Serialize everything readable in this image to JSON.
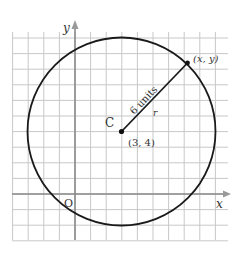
{
  "diagram": {
    "axes": {
      "x_label": "x",
      "y_label": "y",
      "origin_label": "O"
    },
    "center": {
      "name": "C",
      "coords_label": "(3, 4)",
      "x": 3,
      "y": 4
    },
    "point": {
      "label": "(x, y)"
    },
    "radius": {
      "length_label": "6 units",
      "symbol": "r",
      "value": 6
    },
    "grid": {
      "x_range": [
        -4,
        10
      ],
      "y_range": [
        -3,
        11
      ],
      "spacing_units": 1
    },
    "colors": {
      "grid": "#c8c8c8",
      "axis": "#8a8a8a",
      "circle": "#1a1a1a",
      "text": "#333333"
    }
  }
}
